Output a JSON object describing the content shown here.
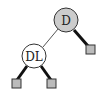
{
  "diagram": {
    "type": "binary-tree",
    "nodes": [
      {
        "id": "root",
        "label": "D",
        "fill": "#cccccc",
        "cx": 66,
        "cy": 20,
        "r": 12
      },
      {
        "id": "left-child",
        "label": "DL",
        "fill": "#ffffff",
        "cx": 34,
        "cy": 56,
        "r": 12
      }
    ],
    "leaves": [
      {
        "id": "root-right-leaf",
        "x": 86,
        "y": 45,
        "size": 9,
        "fill": "#bbbbbb"
      },
      {
        "id": "dl-left-leaf",
        "x": 12,
        "y": 79,
        "size": 9,
        "fill": "#bbbbbb"
      },
      {
        "id": "dl-right-leaf",
        "x": 47,
        "y": 79,
        "size": 9,
        "fill": "#bbbbbb"
      }
    ],
    "edges": [
      {
        "from": "root",
        "to": "left-child",
        "style": "thin"
      },
      {
        "from": "root",
        "to": "root-right-leaf",
        "style": "thick"
      },
      {
        "from": "left-child",
        "to": "dl-left-leaf",
        "style": "thick"
      },
      {
        "from": "left-child",
        "to": "dl-right-leaf",
        "style": "thick"
      }
    ],
    "colors": {
      "stroke": "#333333",
      "thick_edge": "#111111",
      "thin_edge": "#555555"
    }
  }
}
